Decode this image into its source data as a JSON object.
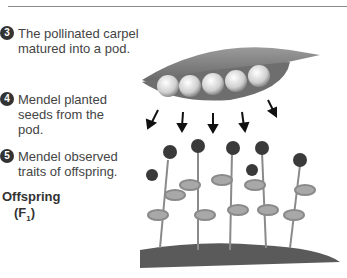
{
  "steps": [
    {
      "number": "3",
      "text_lines": [
        "The pollinated carpel",
        "matured into a pod."
      ]
    },
    {
      "number": "4",
      "text_lines": [
        "Mendel planted",
        "seeds from the",
        "pod."
      ]
    },
    {
      "number": "5",
      "text_lines": [
        "Mendel observed",
        "traits of offspring."
      ]
    }
  ],
  "offspring": {
    "label": "Offspring",
    "generation": "(F",
    "generation_sub": "1",
    "generation_close": ")"
  },
  "illustration": {
    "pod_peas": 5,
    "arrows": 5,
    "plants": 5,
    "palette": "grayscale"
  }
}
